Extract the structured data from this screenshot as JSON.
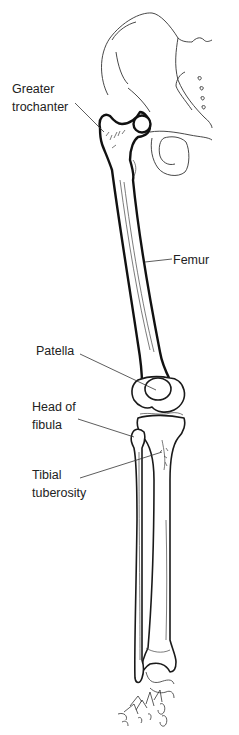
{
  "figure": {
    "labels": {
      "greater_trochanter": [
        "Greater",
        "trochanter"
      ],
      "femur": [
        "Femur"
      ],
      "patella": [
        "Patella"
      ],
      "head_of_fibula": [
        "Head of",
        "fibula"
      ],
      "tibial_tuberosity": [
        "Tibial",
        "tuberosity"
      ]
    },
    "colors": {
      "line": "#1a1a1a",
      "label_text": "#222222",
      "background": "#ffffff"
    }
  }
}
